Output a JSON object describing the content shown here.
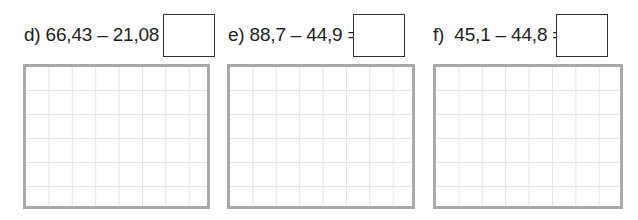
{
  "problems": [
    {
      "id": "d",
      "label": "d) 66,43 – 21,08 =",
      "answer": ""
    },
    {
      "id": "e",
      "label": "e) 88,7 – 44,9 =",
      "answer": ""
    },
    {
      "id": "f",
      "label": "f)  45,1 – 44,8 =",
      "answer": ""
    }
  ],
  "grid": {
    "columns": 8,
    "rows": 6
  }
}
